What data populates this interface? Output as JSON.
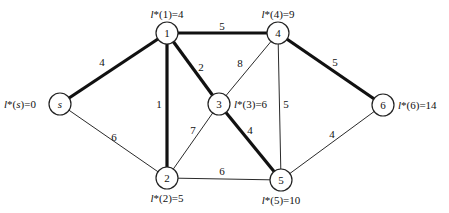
{
  "diagram": {
    "type": "weighted-graph-shortest-path",
    "nodes": [
      {
        "id": "s",
        "label": "s",
        "italic": true,
        "x": 60,
        "y": 104,
        "dist_label": "l*(s)=0",
        "dist_x": 4,
        "dist_y": 104,
        "dist_anchor": "start"
      },
      {
        "id": "1",
        "label": "1",
        "x": 167,
        "y": 33,
        "dist_label": "l*(1)=4",
        "dist_x": 167,
        "dist_y": 14,
        "dist_anchor": "middle"
      },
      {
        "id": "2",
        "label": "2",
        "x": 167,
        "y": 178,
        "dist_label": "l*(2)=5",
        "dist_x": 167,
        "dist_y": 198,
        "dist_anchor": "middle"
      },
      {
        "id": "3",
        "label": "3",
        "x": 219,
        "y": 104,
        "dist_label": "l*(3)=6",
        "dist_x": 234,
        "dist_y": 104,
        "dist_anchor": "start"
      },
      {
        "id": "4",
        "label": "4",
        "x": 278,
        "y": 33,
        "dist_label": "l*(4)=9",
        "dist_x": 278,
        "dist_y": 14,
        "dist_anchor": "middle"
      },
      {
        "id": "5",
        "label": "5",
        "x": 281,
        "y": 180,
        "dist_label": "l*(5)=10",
        "dist_x": 281,
        "dist_y": 200,
        "dist_anchor": "middle"
      },
      {
        "id": "6",
        "label": "6",
        "x": 383,
        "y": 105,
        "dist_label": "l*(6)=14",
        "dist_x": 398,
        "dist_y": 105,
        "dist_anchor": "start"
      }
    ],
    "edges": [
      {
        "from": "s",
        "to": "1",
        "weight": "4",
        "bold": true,
        "wx": 102,
        "wy": 62
      },
      {
        "from": "s",
        "to": "2",
        "weight": "6",
        "bold": false,
        "wx": 114,
        "wy": 137
      },
      {
        "from": "1",
        "to": "2",
        "weight": "1",
        "bold": true,
        "wx": 159,
        "wy": 104
      },
      {
        "from": "1",
        "to": "3",
        "weight": "2",
        "bold": true,
        "wx": 201,
        "wy": 67
      },
      {
        "from": "1",
        "to": "4",
        "weight": "5",
        "bold": true,
        "wx": 222,
        "wy": 26
      },
      {
        "from": "3",
        "to": "4",
        "weight": "8",
        "bold": false,
        "wx": 240,
        "wy": 63
      },
      {
        "from": "2",
        "to": "3",
        "weight": "7",
        "bold": false,
        "wx": 193,
        "wy": 130
      },
      {
        "from": "3",
        "to": "5",
        "weight": "4",
        "bold": true,
        "wx": 250,
        "wy": 130
      },
      {
        "from": "4",
        "to": "5",
        "weight": "5",
        "bold": false,
        "wx": 286,
        "wy": 104
      },
      {
        "from": "2",
        "to": "5",
        "weight": "6",
        "bold": false,
        "wx": 222,
        "wy": 171
      },
      {
        "from": "4",
        "to": "6",
        "weight": "5",
        "bold": true,
        "wx": 335,
        "wy": 62
      },
      {
        "from": "5",
        "to": "6",
        "weight": "4",
        "bold": false,
        "wx": 332,
        "wy": 134
      }
    ]
  }
}
